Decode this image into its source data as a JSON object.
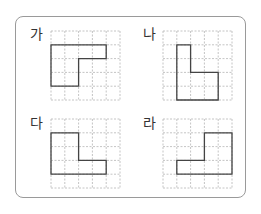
{
  "panels": [
    {
      "label": "가",
      "x": 51,
      "y": 31,
      "label_x": 30,
      "label_y": 27,
      "shape": [
        [
          0,
          1
        ],
        [
          4,
          1
        ],
        [
          4,
          2
        ],
        [
          2,
          2
        ],
        [
          2,
          4
        ],
        [
          0,
          4
        ]
      ]
    },
    {
      "label": "나",
      "x": 163,
      "y": 31,
      "label_x": 143,
      "label_y": 27,
      "shape": [
        [
          1,
          1
        ],
        [
          2,
          1
        ],
        [
          2,
          3
        ],
        [
          4,
          3
        ],
        [
          4,
          5
        ],
        [
          1,
          5
        ]
      ]
    },
    {
      "label": "다",
      "x": 51,
      "y": 119,
      "label_x": 30,
      "label_y": 116,
      "shape": [
        [
          0,
          1
        ],
        [
          2,
          1
        ],
        [
          2,
          3
        ],
        [
          4,
          3
        ],
        [
          4,
          4
        ],
        [
          0,
          4
        ]
      ]
    },
    {
      "label": "라",
      "x": 163,
      "y": 119,
      "label_x": 143,
      "label_y": 116,
      "shape": [
        [
          3,
          1
        ],
        [
          5,
          1
        ],
        [
          5,
          4
        ],
        [
          1,
          4
        ],
        [
          1,
          3
        ],
        [
          3,
          3
        ]
      ]
    }
  ],
  "grid": {
    "cols": 5,
    "rows": 5,
    "cell": 13.8,
    "grid_color": "#b5b5b5",
    "shape_color": "#444444"
  }
}
